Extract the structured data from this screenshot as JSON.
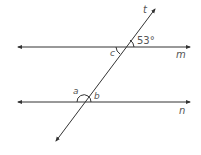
{
  "diagram": {
    "type": "parallel-lines-transversal",
    "lines": {
      "m": {
        "label": "m"
      },
      "n": {
        "label": "n"
      },
      "t": {
        "label": "t"
      }
    },
    "angles": {
      "given": {
        "label": "53°",
        "value": 53
      },
      "a": {
        "label": "a"
      },
      "b": {
        "label": "b"
      },
      "c": {
        "label": "c"
      }
    },
    "colors": {
      "line": "#333333",
      "text": "#555555",
      "background": "#ffffff"
    }
  }
}
